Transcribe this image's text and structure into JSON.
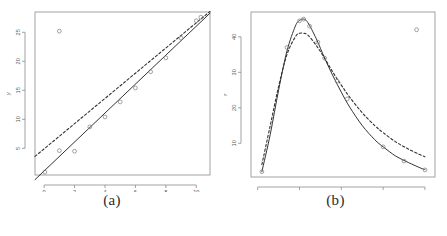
{
  "figure": {
    "panels": [
      {
        "id": "a",
        "caption": "(a)",
        "xlabel": "x",
        "ylabel": "y"
      },
      {
        "id": "b",
        "caption": "(b)",
        "xlabel": "x",
        "ylabel": "y"
      }
    ]
  },
  "chart_data": [
    {
      "type": "scatter",
      "panel": "(a)",
      "title": "",
      "xlabel": "x",
      "ylabel": "y",
      "xlim": [
        -0.6,
        10.9
      ],
      "ylim": [
        0.4,
        28.5
      ],
      "xticks": [
        0,
        2,
        4,
        6,
        8,
        10
      ],
      "yticks": [
        5,
        10,
        15,
        20,
        25
      ],
      "grid": false,
      "legend": "none",
      "points": [
        {
          "x": 1.0,
          "y": 25.2
        },
        {
          "x": 0.05,
          "y": 0.9
        },
        {
          "x": 1.0,
          "y": 4.6
        },
        {
          "x": 2.0,
          "y": 4.5
        },
        {
          "x": 3.0,
          "y": 8.7
        },
        {
          "x": 4.0,
          "y": 10.4
        },
        {
          "x": 5.0,
          "y": 13.0
        },
        {
          "x": 6.0,
          "y": 15.4
        },
        {
          "x": 7.0,
          "y": 18.2
        },
        {
          "x": 8.0,
          "y": 20.6
        },
        {
          "x": 9.0,
          "y": 24.0
        },
        {
          "x": 10.0,
          "y": 27.0
        },
        {
          "x": 10.3,
          "y": 27.6
        }
      ],
      "series": [
        {
          "name": "robust fit",
          "style": "solid",
          "type": "line",
          "x": [
            -0.6,
            10.9
          ],
          "y": [
            -0.4,
            28.3
          ]
        },
        {
          "name": "least-squares fit",
          "style": "dashed",
          "type": "line",
          "x": [
            -0.6,
            10.9
          ],
          "y": [
            3.6,
            28.6
          ]
        }
      ]
    },
    {
      "type": "scatter",
      "panel": "(b)",
      "title": "",
      "xlabel": "x",
      "ylabel": "y",
      "xlim": [
        -8,
        212
      ],
      "ylim": [
        0.5,
        47
      ],
      "xticks": [
        0,
        50,
        100,
        150,
        200
      ],
      "yticks": [
        10,
        20,
        30,
        40
      ],
      "grid": false,
      "legend": "none",
      "points": [
        {
          "x": 190,
          "y": 42.0
        },
        {
          "x": 5,
          "y": 2.0
        },
        {
          "x": 35,
          "y": 37.0
        },
        {
          "x": 50,
          "y": 44.5
        },
        {
          "x": 55,
          "y": 45.0
        },
        {
          "x": 62,
          "y": 43.0
        },
        {
          "x": 72,
          "y": 38.5
        },
        {
          "x": 80,
          "y": 34.0
        },
        {
          "x": 95,
          "y": 27.5
        },
        {
          "x": 107,
          "y": 22.5
        },
        {
          "x": 150,
          "y": 9.0
        },
        {
          "x": 175,
          "y": 5.0
        },
        {
          "x": 200,
          "y": 2.5
        }
      ],
      "series": [
        {
          "name": "robust fit",
          "style": "solid",
          "type": "curve",
          "x": [
            5,
            15,
            25,
            35,
            45,
            50,
            55,
            60,
            70,
            80,
            90,
            100,
            110,
            125,
            140,
            150,
            165,
            180,
            195,
            200
          ],
          "y": [
            2.0,
            12.5,
            25.0,
            36.0,
            43.0,
            44.6,
            45.0,
            44.0,
            39.5,
            34.0,
            29.0,
            24.4,
            20.2,
            15.0,
            11.0,
            9.0,
            6.4,
            4.6,
            3.0,
            2.6
          ]
        },
        {
          "name": "least-squares fit",
          "style": "dashed",
          "type": "curve",
          "x": [
            5,
            15,
            25,
            35,
            45,
            50,
            55,
            60,
            70,
            80,
            90,
            100,
            110,
            125,
            140,
            150,
            165,
            180,
            195,
            200
          ],
          "y": [
            4.0,
            15.0,
            26.0,
            35.0,
            40.0,
            41.0,
            41.0,
            40.5,
            37.6,
            34.0,
            30.0,
            26.4,
            23.0,
            18.6,
            15.0,
            13.0,
            10.4,
            8.4,
            6.7,
            6.2
          ]
        }
      ]
    }
  ],
  "style": {
    "axis_color": "#8a8a8a",
    "point_color": "#7a7a7a",
    "solid_line_color": "#333333",
    "dashed_line_color": "#333333",
    "caption_color": "#2b2b2b"
  }
}
